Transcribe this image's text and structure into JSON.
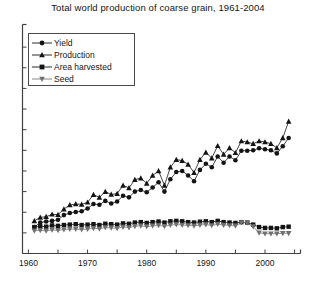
{
  "chart_data": {
    "type": "line",
    "title": "Total world production of coarse grain, 1961-2004",
    "xlabel": "",
    "ylabel": "",
    "xlim": [
      1959,
      2006
    ],
    "ylim": [
      0,
      1100
    ],
    "grid": false,
    "legend_position": "upper-left",
    "xticks": [
      1960,
      1965,
      1970,
      1975,
      1980,
      1985,
      1990,
      1995,
      2000,
      2005
    ],
    "xticklabels": [
      "1960",
      "",
      "1970",
      "",
      "1980",
      "",
      "1990",
      "",
      "2000",
      ""
    ],
    "yticks": [
      0,
      100,
      200,
      300,
      400,
      500,
      600,
      700,
      800,
      900,
      1000
    ],
    "yticklabels": [
      "",
      "",
      "",
      "",
      "",
      "",
      "",
      "",
      "",
      "",
      ""
    ],
    "x": [
      1961,
      1962,
      1963,
      1964,
      1965,
      1966,
      1967,
      1968,
      1969,
      1970,
      1971,
      1972,
      1973,
      1974,
      1975,
      1976,
      1977,
      1978,
      1979,
      1980,
      1981,
      1982,
      1983,
      1984,
      1985,
      1986,
      1987,
      1988,
      1989,
      1990,
      1991,
      1992,
      1993,
      1994,
      1995,
      1996,
      1997,
      1998,
      1999,
      2000,
      2001,
      2002,
      2003,
      2004
    ],
    "series": [
      {
        "name": "Yield",
        "marker": "circle",
        "values": [
          128,
          150,
          155,
          158,
          163,
          186,
          196,
          201,
          205,
          218,
          240,
          236,
          255,
          242,
          252,
          280,
          272,
          300,
          308,
          297,
          320,
          345,
          300,
          360,
          395,
          400,
          378,
          350,
          405,
          435,
          418,
          470,
          440,
          470,
          452,
          498,
          498,
          500,
          510,
          505,
          500,
          485,
          520,
          560
        ]
      },
      {
        "name": "Production",
        "marker": "triangle-up",
        "values": [
          158,
          175,
          178,
          190,
          188,
          215,
          235,
          240,
          238,
          248,
          285,
          272,
          300,
          286,
          290,
          330,
          318,
          358,
          365,
          340,
          378,
          400,
          330,
          418,
          455,
          450,
          432,
          392,
          455,
          490,
          462,
          522,
          480,
          512,
          488,
          545,
          540,
          532,
          545,
          540,
          532,
          512,
          560,
          640
        ]
      },
      {
        "name": "Area harvested",
        "marker": "square",
        "values": [
          128,
          132,
          130,
          136,
          134,
          138,
          140,
          142,
          138,
          140,
          142,
          138,
          144,
          142,
          140,
          146,
          144,
          150,
          152,
          148,
          152,
          155,
          150,
          156,
          158,
          156,
          152,
          150,
          154,
          156,
          152,
          158,
          152,
          150,
          148,
          152,
          150,
          140,
          128,
          124,
          124,
          122,
          128,
          130
        ]
      },
      {
        "name": "Seed",
        "marker": "triangle-down",
        "values": [
          110,
          112,
          110,
          114,
          112,
          116,
          118,
          118,
          116,
          118,
          122,
          120,
          126,
          124,
          122,
          128,
          126,
          132,
          134,
          130,
          134,
          136,
          132,
          138,
          140,
          138,
          136,
          134,
          138,
          140,
          136,
          142,
          138,
          136,
          134,
          150,
          148,
          130,
          100,
          96,
          96,
          96,
          98,
          98
        ]
      }
    ]
  },
  "legend": {
    "items": [
      {
        "label": "Yield",
        "marker": "circle-marker"
      },
      {
        "label": "Production",
        "marker": "triangle-up-marker"
      },
      {
        "label": "Area harvested",
        "marker": "square-marker"
      },
      {
        "label": "Seed",
        "marker": "triangle-down-marker"
      }
    ]
  },
  "colors": {
    "axis": "#3f3f3f",
    "series_dark": "#141414",
    "series_gray": "#7a7a7a",
    "background": "#ffffff",
    "text": "#161616"
  }
}
